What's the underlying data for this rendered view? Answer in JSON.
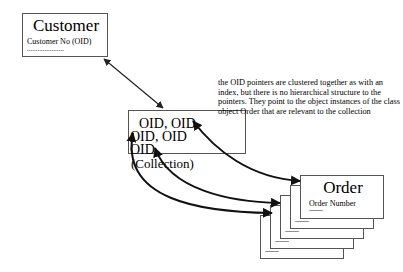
{
  "customer": {
    "title": "Customer",
    "field": "Customer No   (OID)",
    "dots": "....................."
  },
  "collection": {
    "oids": [
      "OID, OID",
      "OID, OID",
      "OID,"
    ],
    "label": "(Collection)"
  },
  "note": {
    "text": "the OID pointers are clustered together as with an index, but there is no hierarchical structure to the pointers. They point to the object instances of the class object Order that are relevant to the collection"
  },
  "order": {
    "title": "Order",
    "field": "Order Number",
    "dots": "---------",
    "stack_dots": [
      "---------",
      "---------",
      "---------",
      "---------"
    ]
  },
  "colors": {
    "line": "#222222",
    "border": "#555555",
    "background": "#ffffff"
  }
}
